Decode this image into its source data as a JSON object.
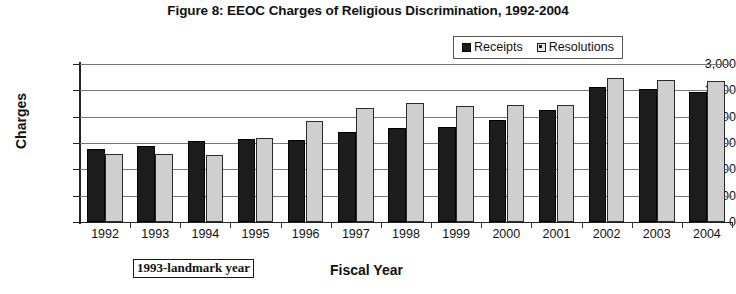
{
  "figure": {
    "title": "Figure 8: EEOC Charges of Religious Discrimination, 1992-2004",
    "annotation": "1993-landmark year"
  },
  "legend": {
    "position": "top-right-inside",
    "entries": [
      {
        "label": "Receipts",
        "swatch": "black-square-icon",
        "color": "#1c1c1c"
      },
      {
        "label": "Resolutions",
        "swatch": "white-square-icon",
        "color": "#cfcfcf"
      }
    ]
  },
  "chart_data": {
    "type": "bar",
    "title": "Figure 8: EEOC Charges of Religious Discrimination, 1992-2004",
    "xlabel": "Fiscal Year",
    "ylabel": "Charges",
    "ylim": [
      0,
      3000
    ],
    "ytick_values": [
      0,
      500,
      1000,
      1500,
      2000,
      2500,
      3000
    ],
    "ytick_labels": [
      "0",
      "500",
      "1,000",
      "1,500",
      "2,000",
      "2,500",
      "3,000"
    ],
    "grid": true,
    "grid_axis": "y",
    "legend_position": "upper right",
    "categories": [
      "1992",
      "1993",
      "1994",
      "1995",
      "1996",
      "1997",
      "1998",
      "1999",
      "2000",
      "2001",
      "2002",
      "2003",
      "2004"
    ],
    "series": [
      {
        "name": "Receipts",
        "color": "#1c1c1c",
        "values": [
          1388,
          1449,
          1546,
          1581,
          1564,
          1709,
          1786,
          1811,
          1939,
          2127,
          2572,
          2532,
          2466
        ]
      },
      {
        "name": "Resolutions",
        "color": "#cfcfcf",
        "values": [
          1300,
          1284,
          1278,
          1591,
          1918,
          2162,
          2252,
          2196,
          2230,
          2217,
          2729,
          2690,
          2676
        ]
      }
    ],
    "annotations": [
      {
        "text": "1993-landmark year",
        "location": "below-x-axis-left",
        "boxed": true
      }
    ]
  }
}
